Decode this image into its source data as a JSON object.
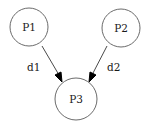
{
  "diagram": {
    "type": "directed-graph",
    "nodes": [
      {
        "id": "P1",
        "label": "P1"
      },
      {
        "id": "P2",
        "label": "P2"
      },
      {
        "id": "P3",
        "label": "P3"
      }
    ],
    "edges": [
      {
        "from": "P1",
        "to": "P3",
        "label": "d1"
      },
      {
        "from": "P2",
        "to": "P3",
        "label": "d2"
      }
    ],
    "colors": {
      "background": "#ffffff",
      "node_stroke": "#6b6b6b",
      "edge_stroke": "#4a4a4a",
      "arrow_fill": "#000000",
      "text": "#1a1a1a"
    }
  }
}
